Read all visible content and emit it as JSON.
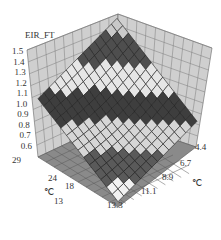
{
  "chart_data": {
    "type": "surface3d",
    "title": "",
    "zlabel": "EIR_FT",
    "z_ticks": [
      "1.5",
      "1.4",
      "1.3",
      "1.2",
      "1.1",
      "1.0",
      "0.9",
      "0.8",
      "0.7",
      "0.6"
    ],
    "zlim": [
      0.6,
      1.5
    ],
    "x_axis": {
      "label": "℃",
      "ticks": [
        "29",
        "24",
        "18",
        "13"
      ],
      "description": "outdoor dry-bulb temperature (left floor axis)"
    },
    "y_axis": {
      "label": "℃",
      "ticks": [
        "4.4",
        "6.7",
        "8.9",
        "11.1",
        "13.3"
      ],
      "description": "chilled water temperature (right floor axis)"
    },
    "grid": true,
    "colormap": "banded grayscale (light/dark alternating bands by z level)",
    "surface_description": "Surface rises from ~0.6 at low x-axis temp / low y-axis temp corner to ~1.5 at high back corner; mild curvature",
    "corner_values_estimate": {
      "x29_y4.4": 0.9,
      "x13_y4.4": 0.6,
      "x29_y13.3": 1.5,
      "x13_y13.3": 1.0
    }
  },
  "labels": {
    "zlabel": "EIR_FT",
    "z_ticks": [
      "1.5",
      "1.4",
      "1.3",
      "1.2",
      "1.1",
      "1.0",
      "0.9",
      "0.8",
      "0.7",
      "0.6"
    ],
    "x_ticks": [
      "29",
      "24",
      "18",
      "13"
    ],
    "x_unit": "℃",
    "y_ticks": [
      "4.4",
      "6.7",
      "8.9",
      "11.1",
      "13.3"
    ],
    "y_unit": "℃"
  }
}
